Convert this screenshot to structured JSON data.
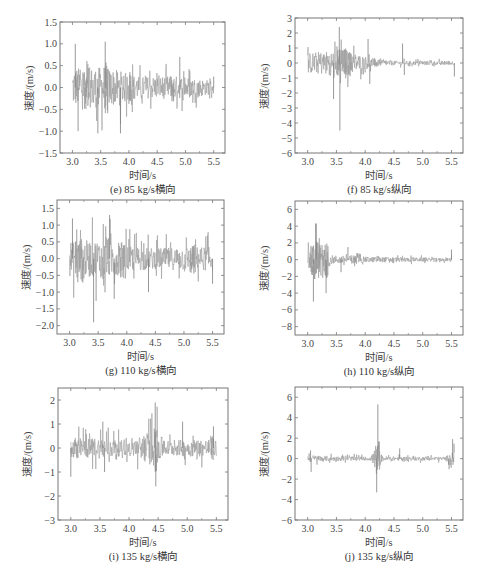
{
  "chart_data": [
    {
      "id": "e",
      "type": "line",
      "caption": "(e) 85 kg/s横向",
      "xlabel": "时间/s",
      "ylabel": "速度/(m/s)",
      "legend": "85 kg/s",
      "xlim": [
        2.78,
        5.7
      ],
      "ylim": [
        -1.5,
        1.5
      ],
      "xticks": [
        3.0,
        3.5,
        4.0,
        4.5,
        5.0,
        5.5
      ],
      "xtick_labels": [
        "3.0",
        "3.5",
        "4.0",
        "4.5",
        "5.0",
        "5.5"
      ],
      "yticks": [
        -1.5,
        -1.0,
        -0.5,
        0.0,
        0.5,
        1.0,
        1.5
      ],
      "ytick_labels": [
        "−1.5",
        "−1.0",
        "−0.5",
        "0.0",
        "0.5",
        "1.0",
        "1.5"
      ],
      "series": [
        {
          "name": "85 kg/s",
          "t_start": 3.0,
          "t_end": 5.5,
          "envelope": [
            [
              3.0,
              1.0
            ],
            [
              3.6,
              1.05
            ],
            [
              3.9,
              0.8
            ],
            [
              4.2,
              0.55
            ],
            [
              4.8,
              0.6
            ],
            [
              5.5,
              0.35
            ]
          ],
          "peaks": [
            [
              3.05,
              1.0
            ],
            [
              3.1,
              -1.0
            ],
            [
              3.45,
              -1.05
            ],
            [
              3.58,
              1.05
            ],
            [
              3.85,
              -1.05
            ],
            [
              4.9,
              0.7
            ],
            [
              5.5,
              0.25
            ]
          ],
          "dense_segments": [
            [
              3.2,
              3.3
            ],
            [
              3.55,
              3.62
            ],
            [
              4.0,
              4.05
            ],
            [
              4.75,
              4.8
            ]
          ]
        }
      ],
      "grid": false,
      "legend_position": "upper right"
    },
    {
      "id": "f",
      "type": "line",
      "caption": "(f) 85 kg/s纵向",
      "xlabel": "时间/s",
      "ylabel": "速度/(m/s)",
      "legend": "85 kg/s",
      "xlim": [
        2.78,
        5.7
      ],
      "ylim": [
        -6,
        3
      ],
      "xticks": [
        3.0,
        3.5,
        4.0,
        4.5,
        5.0,
        5.5
      ],
      "xtick_labels": [
        "3.0",
        "3.5",
        "4.0",
        "4.5",
        "5.0",
        "5.5"
      ],
      "yticks": [
        -6,
        -5,
        -4,
        -3,
        -2,
        -1,
        0,
        1,
        2,
        3
      ],
      "ytick_labels": [
        "−6",
        "−5",
        "−4",
        "−3",
        "−2",
        "−1",
        "0",
        "1",
        "2",
        "3"
      ],
      "series": [
        {
          "name": "85 kg/s",
          "t_start": 3.0,
          "t_end": 5.55,
          "envelope": [
            [
              3.0,
              1.5
            ],
            [
              3.5,
              2.0
            ],
            [
              3.8,
              1.5
            ],
            [
              4.2,
              0.5
            ],
            [
              4.6,
              0.3
            ],
            [
              5.5,
              0.3
            ]
          ],
          "peaks": [
            [
              3.55,
              2.4
            ],
            [
              3.56,
              -4.5
            ],
            [
              3.45,
              -2.4
            ],
            [
              4.05,
              1.6
            ],
            [
              4.08,
              -1.4
            ],
            [
              4.65,
              1.3
            ],
            [
              4.68,
              -0.8
            ],
            [
              5.55,
              -0.9
            ]
          ],
          "dense_segments": [
            [
              3.5,
              3.75
            ],
            [
              4.15,
              4.2
            ]
          ]
        }
      ],
      "grid": false,
      "legend_position": "upper right"
    },
    {
      "id": "g",
      "type": "line",
      "caption": "(g) 110 kg/s横向",
      "xlabel": "时间/s",
      "ylabel": "速度/(m/s)",
      "legend": "110 kg/s",
      "xlim": [
        2.78,
        5.7
      ],
      "ylim": [
        -2.25,
        1.75
      ],
      "xticks": [
        3.0,
        3.5,
        4.0,
        4.5,
        5.0,
        5.5
      ],
      "xtick_labels": [
        "3.0",
        "3.5",
        "4.0",
        "4.5",
        "5.0",
        "5.5"
      ],
      "yticks": [
        -2.0,
        -1.5,
        -1.0,
        -0.5,
        0.0,
        0.5,
        1.0,
        1.5
      ],
      "ytick_labels": [
        "−2.0",
        "−1.5",
        "−1.0",
        "−0.5",
        "0.0",
        "0.5",
        "1.0",
        "1.5"
      ],
      "series": [
        {
          "name": "110 kg/s",
          "t_start": 3.0,
          "t_end": 5.5,
          "envelope": [
            [
              3.0,
              1.2
            ],
            [
              3.7,
              1.3
            ],
            [
              4.0,
              0.9
            ],
            [
              4.5,
              0.7
            ],
            [
              5.0,
              0.8
            ],
            [
              5.5,
              0.8
            ]
          ],
          "peaks": [
            [
              3.05,
              1.2
            ],
            [
              3.42,
              -1.9
            ],
            [
              3.7,
              1.3
            ],
            [
              3.78,
              -1.2
            ],
            [
              4.38,
              -1.0
            ],
            [
              5.5,
              -0.75
            ]
          ],
          "dense_segments": [
            [
              3.1,
              3.25
            ],
            [
              3.85,
              3.95
            ],
            [
              5.1,
              5.2
            ]
          ]
        }
      ],
      "grid": false,
      "legend_position": "upper right"
    },
    {
      "id": "h",
      "type": "line",
      "caption": "(h) 110 kg/s纵向",
      "xlabel": "时间/s",
      "ylabel": "速度/(m/s)",
      "legend": "110 kg/s",
      "xlim": [
        2.78,
        5.7
      ],
      "ylim": [
        -9,
        7
      ],
      "xticks": [
        3.0,
        3.5,
        4.0,
        4.5,
        5.0,
        5.5
      ],
      "xtick_labels": [
        "3.0",
        "3.5",
        "4.0",
        "4.5",
        "5.0",
        "5.5"
      ],
      "yticks": [
        -8,
        -6,
        -4,
        -2,
        0,
        2,
        4,
        6
      ],
      "ytick_labels": [
        "−8",
        "−6",
        "−4",
        "−2",
        "0",
        "2",
        "4",
        "6"
      ],
      "series": [
        {
          "name": "110 kg/s",
          "t_start": 3.0,
          "t_end": 5.5,
          "envelope": [
            [
              3.0,
              2.0
            ],
            [
              3.15,
              4.5
            ],
            [
              3.35,
              3.5
            ],
            [
              3.4,
              1.2
            ],
            [
              4.0,
              0.8
            ],
            [
              5.5,
              0.4
            ]
          ],
          "peaks": [
            [
              3.15,
              4.3
            ],
            [
              3.1,
              -5.0
            ],
            [
              3.32,
              -4.0
            ],
            [
              3.7,
              1.5
            ],
            [
              3.58,
              -1.5
            ],
            [
              5.5,
              1.2
            ]
          ],
          "dense_segments": [
            [
              3.05,
              3.35
            ],
            [
              3.75,
              3.85
            ]
          ]
        }
      ],
      "grid": false,
      "legend_position": "upper right"
    },
    {
      "id": "i",
      "type": "line",
      "caption": "(i) 135 kg/s横向",
      "xlabel": "时间/s",
      "ylabel": "速度/(m/s)",
      "legend": "135 kg/s",
      "xlim": [
        2.78,
        5.7
      ],
      "ylim": [
        -3,
        2.5
      ],
      "xticks": [
        3.0,
        3.5,
        4.0,
        4.5,
        5.0,
        5.5
      ],
      "xtick_labels": [
        "3.0",
        "3.5",
        "4.0",
        "4.5",
        "5.0",
        "5.5"
      ],
      "yticks": [
        -3,
        -2,
        -1,
        0,
        1,
        2
      ],
      "ytick_labels": [
        "−3",
        "−2",
        "−1",
        "0",
        "1",
        "2"
      ],
      "series": [
        {
          "name": "135 kg/s",
          "t_start": 3.0,
          "t_end": 5.5,
          "envelope": [
            [
              3.0,
              0.9
            ],
            [
              3.6,
              1.0
            ],
            [
              4.0,
              0.6
            ],
            [
              4.45,
              1.8
            ],
            [
              4.6,
              0.7
            ],
            [
              5.5,
              0.9
            ]
          ],
          "peaks": [
            [
              3.0,
              -1.2
            ],
            [
              3.55,
              1.1
            ],
            [
              3.58,
              -1.0
            ],
            [
              4.45,
              1.9
            ],
            [
              4.46,
              -1.6
            ],
            [
              4.92,
              1.1
            ],
            [
              5.45,
              0.9
            ]
          ],
          "dense_segments": [
            [
              3.05,
              3.12
            ],
            [
              4.43,
              4.5
            ],
            [
              5.4,
              5.45
            ]
          ]
        }
      ],
      "grid": false,
      "legend_position": "upper right"
    },
    {
      "id": "j",
      "type": "line",
      "caption": "(j) 135 kg/s纵向",
      "xlabel": "时间/s",
      "ylabel": "速度/(m/s)",
      "legend": "135 kg/s",
      "xlim": [
        2.78,
        5.7
      ],
      "ylim": [
        -6,
        7
      ],
      "xticks": [
        3.0,
        3.5,
        4.0,
        4.5,
        5.0,
        5.5
      ],
      "xtick_labels": [
        "3.0",
        "3.5",
        "4.0",
        "4.5",
        "5.0",
        "5.5"
      ],
      "yticks": [
        -6,
        -4,
        -2,
        0,
        2,
        4,
        6
      ],
      "ytick_labels": [
        "−6",
        "−4",
        "−2",
        "0",
        "2",
        "4",
        "6"
      ],
      "series": [
        {
          "name": "135 kg/s",
          "t_start": 3.0,
          "t_end": 5.55,
          "envelope": [
            [
              3.0,
              0.8
            ],
            [
              3.5,
              0.5
            ],
            [
              4.1,
              0.4
            ],
            [
              4.2,
              3.0
            ],
            [
              4.3,
              0.5
            ],
            [
              5.4,
              0.4
            ],
            [
              5.5,
              1.5
            ]
          ],
          "peaks": [
            [
              3.05,
              0.8
            ],
            [
              3.06,
              -1.3
            ],
            [
              4.22,
              5.3
            ],
            [
              4.2,
              -3.3
            ],
            [
              4.6,
              1.0
            ],
            [
              5.52,
              1.9
            ],
            [
              5.45,
              -0.6
            ]
          ],
          "dense_segments": [
            [
              4.17,
              4.25
            ]
          ]
        }
      ],
      "grid": false,
      "legend_position": "upper right"
    }
  ],
  "layout": {
    "panels": [
      {
        "id": "e",
        "frame": [
          60,
          22,
          225,
          153
        ]
      },
      {
        "id": "f",
        "frame": [
          295,
          18,
          463,
          153
        ]
      },
      {
        "id": "g",
        "frame": [
          57,
          200,
          224,
          334
        ]
      },
      {
        "id": "h",
        "frame": [
          295,
          201,
          463,
          335
        ]
      },
      {
        "id": "i",
        "frame": [
          58,
          388,
          228,
          520
        ]
      },
      {
        "id": "j",
        "frame": [
          295,
          387,
          463,
          520
        ]
      }
    ],
    "trace_color": "#9a9a9a",
    "axis_color": "#777777"
  }
}
